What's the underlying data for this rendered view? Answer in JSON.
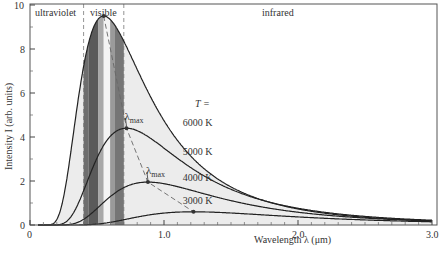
{
  "chart_data": {
    "type": "line",
    "title": "",
    "xlabel": "Wavelength λ (μm)",
    "ylabel": "Intensity I (arb. units)",
    "xlim": [
      0,
      3.0
    ],
    "ylim": [
      0,
      10
    ],
    "xticks": [
      {
        "v": 0,
        "label": "0"
      },
      {
        "v": 1.0,
        "label": "1.0"
      },
      {
        "v": 2.0,
        "label": "2.0"
      },
      {
        "v": 3.0,
        "label": "3.0"
      }
    ],
    "yticks": [
      {
        "v": 0,
        "label": "0"
      },
      {
        "v": 2,
        "label": "2"
      },
      {
        "v": 4,
        "label": "4"
      },
      {
        "v": 6,
        "label": "6"
      },
      {
        "v": 8,
        "label": "8"
      },
      {
        "v": 10,
        "label": "10"
      }
    ],
    "grid": false,
    "regions": [
      {
        "label": "ultraviolet",
        "from": 0,
        "to": 0.4
      },
      {
        "label": "visible",
        "from": 0.4,
        "to": 0.7
      },
      {
        "label": "infrared",
        "from": 0.7,
        "to": 3.0
      }
    ],
    "legend_header": "T =",
    "series": [
      {
        "name": "6000 K",
        "peak_lambda": 0.55,
        "peak_intensity": 9.5,
        "label_pos": [
          1.14,
          4.5
        ]
      },
      {
        "name": "5000 K",
        "peak_lambda": 0.72,
        "peak_intensity": 4.4,
        "label_pos": [
          1.14,
          3.2
        ]
      },
      {
        "name": "4000 K",
        "peak_lambda": 0.88,
        "peak_intensity": 1.95,
        "label_pos": [
          1.14,
          2.0
        ]
      },
      {
        "name": "3000 K",
        "peak_lambda": 1.22,
        "peak_intensity": 0.6,
        "label_pos": [
          1.14,
          0.95
        ]
      }
    ],
    "annotations": [
      {
        "text": "λmax",
        "at": [
          0.72,
          4.4
        ]
      },
      {
        "text": "λmax",
        "at": [
          0.88,
          1.95
        ]
      }
    ]
  }
}
